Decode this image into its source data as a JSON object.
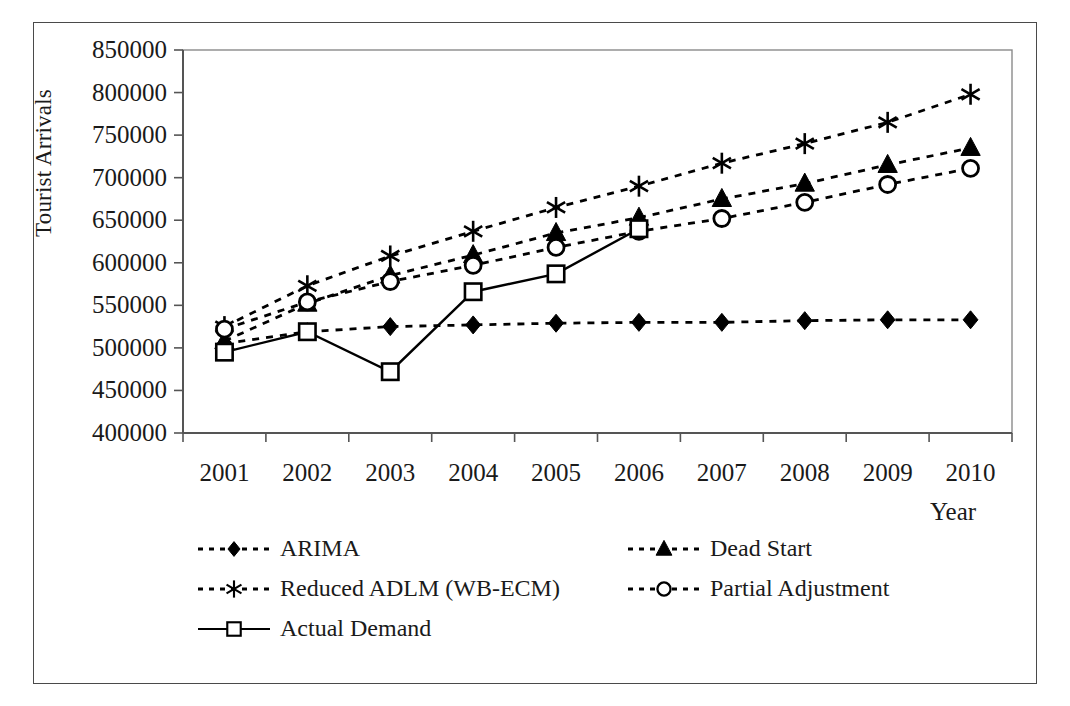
{
  "chart_data": {
    "type": "line",
    "title": "",
    "xlabel": "Year",
    "ylabel": "Tourist Arrivals",
    "categories": [
      "2001",
      "2002",
      "2003",
      "2004",
      "2005",
      "2006",
      "2007",
      "2008",
      "2009",
      "2010"
    ],
    "x": [
      2001,
      2002,
      2003,
      2004,
      2005,
      2006,
      2007,
      2008,
      2009,
      2010
    ],
    "xlim": [
      2000.5,
      2010.5
    ],
    "ylim": [
      400000,
      850000
    ],
    "ytick_labels": [
      "400000",
      "450000",
      "500000",
      "550000",
      "600000",
      "650000",
      "700000",
      "750000",
      "800000",
      "850000"
    ],
    "yticks": [
      400000,
      450000,
      500000,
      550000,
      600000,
      650000,
      700000,
      750000,
      800000,
      850000
    ],
    "grid": false,
    "legend_position": "below-axes",
    "series": [
      {
        "name": "ARIMA",
        "marker": "filled-diamond",
        "linestyle": "dotted",
        "color": "#000000",
        "values": [
          505000,
          519000,
          525000,
          527000,
          529000,
          530000,
          530000,
          532000,
          533000,
          533000
        ]
      },
      {
        "name": "Dead Start",
        "marker": "filled-triangle",
        "linestyle": "dotted",
        "color": "#000000",
        "values": [
          508000,
          552000,
          585000,
          609000,
          635000,
          653000,
          675000,
          693000,
          715000,
          735000
        ]
      },
      {
        "name": "Reduced ADLM (WB-ECM)",
        "marker": "asterisk",
        "linestyle": "dotted",
        "color": "#000000",
        "values": [
          525000,
          573000,
          608000,
          637000,
          665000,
          690000,
          717000,
          740000,
          765000,
          798000
        ]
      },
      {
        "name": "Partial Adjustment",
        "marker": "open-circle",
        "linestyle": "dotted",
        "color": "#000000",
        "values": [
          522000,
          554000,
          578000,
          597000,
          618000,
          637000,
          652000,
          671000,
          692000,
          711000
        ]
      },
      {
        "name": "Actual Demand",
        "marker": "open-square",
        "linestyle": "solid",
        "color": "#000000",
        "values": [
          495000,
          519000,
          472000,
          566000,
          587000,
          640000,
          null,
          null,
          null,
          null
        ]
      }
    ]
  },
  "axes": {
    "ylabel": "Tourist Arrivals",
    "xlabel": "Year"
  },
  "legend": {
    "rows": [
      [
        {
          "label": "ARIMA",
          "marker": "filled-diamond",
          "linestyle": "dotted"
        },
        {
          "label": "Dead Start",
          "marker": "filled-triangle",
          "linestyle": "dotted"
        }
      ],
      [
        {
          "label": "Reduced ADLM (WB-ECM)",
          "marker": "asterisk",
          "linestyle": "dotted"
        },
        {
          "label": "Partial Adjustment",
          "marker": "open-circle",
          "linestyle": "dotted"
        }
      ],
      [
        {
          "label": "Actual Demand",
          "marker": "open-square",
          "linestyle": "solid"
        }
      ]
    ]
  },
  "colors": {
    "ink": "#000000",
    "frame": "#4a4a4a",
    "background": "#ffffff"
  }
}
